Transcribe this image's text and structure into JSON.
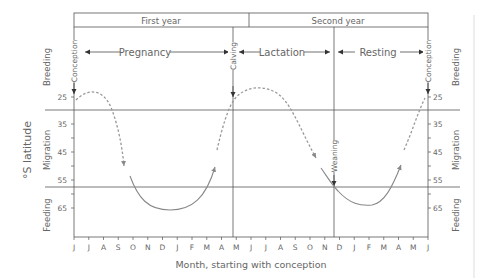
{
  "header": {
    "first_year": "First year",
    "second_year": "Second year"
  },
  "phases": {
    "pregnancy": "Pregnancy",
    "lactation": "Lactation",
    "resting": "Resting"
  },
  "events": {
    "conception_start": "Conception",
    "calving": "Calving",
    "weaning": "Weaning",
    "conception_end": "Conception"
  },
  "zones": {
    "left": [
      "Breeding",
      "Migration",
      "Feeding"
    ],
    "right": [
      "Breeding",
      "Migration",
      "Feeding"
    ]
  },
  "axes": {
    "ylabel": "°S latitude",
    "xlabel": "Month, starting with conception",
    "y_ticks_left": [
      "25",
      "35",
      "45",
      "55",
      "65"
    ],
    "y_ticks_right": [
      "25",
      "35",
      "45",
      "55",
      "65"
    ],
    "months": [
      "J",
      "J",
      "A",
      "S",
      "O",
      "N",
      "D",
      "J",
      "F",
      "M",
      "A",
      "M",
      "J",
      "J",
      "A",
      "S",
      "O",
      "N",
      "D",
      "J",
      "F",
      "M",
      "A",
      "M",
      "J"
    ]
  },
  "colors": {
    "line": "#555555",
    "curve": "#888888",
    "text": "#666666"
  }
}
